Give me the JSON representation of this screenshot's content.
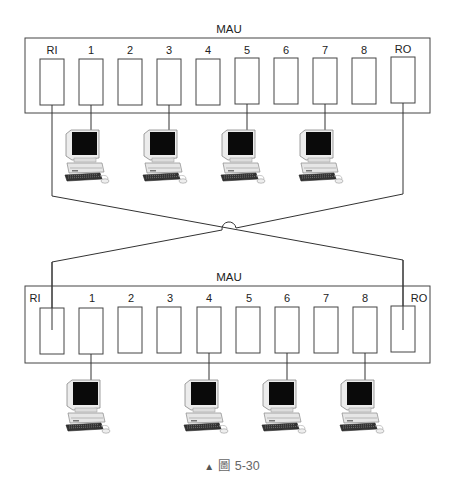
{
  "diagram": {
    "top_mau": {
      "label": "MAU",
      "ports": [
        "RI",
        "1",
        "2",
        "3",
        "4",
        "5",
        "6",
        "7",
        "8",
        "RO"
      ],
      "connected_ports": [
        "1",
        "3",
        "5",
        "7"
      ]
    },
    "bottom_mau": {
      "label": "MAU",
      "ports": [
        "RI",
        "1",
        "2",
        "3",
        "4",
        "5",
        "6",
        "7",
        "8",
        "RO"
      ],
      "connected_ports": [
        "1",
        "4",
        "6",
        "8"
      ]
    },
    "links": [
      {
        "from": "top_mau.RI",
        "to": "bottom_mau.RO",
        "note": "crosses with hop-over arc"
      },
      {
        "from": "top_mau.RO",
        "to": "bottom_mau.RI"
      }
    ],
    "workstation_icon": "desktop-computer-icon",
    "colors": {
      "line": "#333333",
      "background": "#ffffff",
      "caption": "#666666"
    }
  },
  "caption": {
    "marker": "▲",
    "text": "圖 5-30"
  },
  "clipped_header_text": "................"
}
